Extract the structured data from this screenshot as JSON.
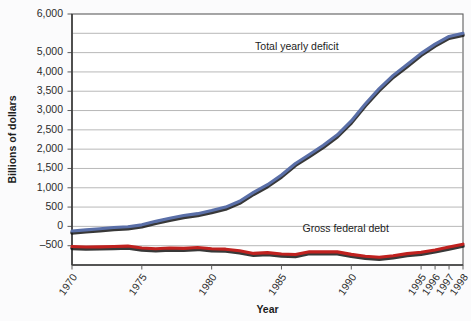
{
  "chart_data": {
    "type": "line",
    "title": "",
    "xlabel": "Year",
    "ylabel": "Billions of dollars",
    "ylim": [
      -500,
      6000
    ],
    "grid": true,
    "legend_position": "inline-annotations",
    "y_tick_labels": [
      "6,000",
      "5,000",
      "4,000",
      "3,500",
      "3,000",
      "2,500",
      "2,000",
      "1,500",
      "1,000",
      "500",
      "0",
      "-500"
    ],
    "y_tick_values": [
      6000,
      5500,
      5000,
      4500,
      4000,
      3500,
      3000,
      2500,
      2000,
      1500,
      1000,
      500,
      0,
      -500
    ],
    "x_tick_labels": [
      "1970",
      "1975",
      "1980",
      "1985",
      "1990",
      "1995",
      "1996",
      "1997",
      "1998"
    ],
    "x_tick_values": [
      1970,
      1975,
      1980,
      1985,
      1990,
      1995,
      1996,
      1997,
      1998
    ],
    "xlim": [
      1970,
      1998
    ],
    "series": [
      {
        "name": "Total yearly deficit",
        "color": "#5a6fa8",
        "label_x": 1986.1,
        "label_y": 5080,
        "x": [
          1970,
          1971,
          1972,
          1973,
          1974,
          1975,
          1976,
          1977,
          1978,
          1979,
          1980,
          1981,
          1982,
          1983,
          1984,
          1985,
          1986,
          1987,
          1988,
          1989,
          1990,
          1991,
          1992,
          1993,
          1994,
          1995,
          1996,
          1997,
          1998
        ],
        "values": [
          380,
          410,
          440,
          470,
          490,
          540,
          630,
          710,
          780,
          830,
          910,
          1000,
          1150,
          1380,
          1580,
          1830,
          2130,
          2360,
          2600,
          2870,
          3230,
          3670,
          4070,
          4410,
          4690,
          4980,
          5220,
          5420,
          5500
        ]
      },
      {
        "name": "Gross federal debt",
        "color": "#c0211f",
        "label_x": 1989.6,
        "label_y": 345,
        "x": [
          1970,
          1971,
          1972,
          1973,
          1974,
          1975,
          1976,
          1977,
          1978,
          1979,
          1980,
          1981,
          1982,
          1983,
          1984,
          1985,
          1986,
          1987,
          1988,
          1989,
          1990,
          1991,
          1992,
          1993,
          1994,
          1995,
          1996,
          1997,
          1998
        ],
        "values": [
          -20,
          -35,
          -30,
          -20,
          -10,
          -60,
          -80,
          -60,
          -70,
          -45,
          -80,
          -90,
          -130,
          -200,
          -180,
          -215,
          -230,
          -155,
          -160,
          -160,
          -225,
          -275,
          -300,
          -260,
          -205,
          -170,
          -110,
          -35,
          40
        ]
      }
    ]
  }
}
